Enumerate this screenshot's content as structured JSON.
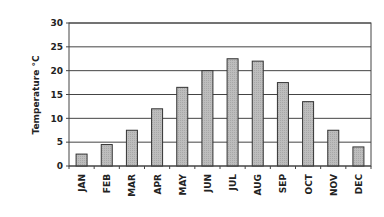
{
  "chart_data": {
    "type": "bar",
    "title": "",
    "xlabel": "",
    "ylabel": "Temperature °C",
    "ylim": [
      0,
      30
    ],
    "yticks": [
      0,
      5,
      10,
      15,
      20,
      25,
      30
    ],
    "grid": true,
    "legend": null,
    "categories": [
      "JAN",
      "FEB",
      "MAR",
      "APR",
      "MAY",
      "JUN",
      "JUL",
      "AUG",
      "SEP",
      "OCT",
      "NOV",
      "DEC"
    ],
    "values": [
      2.5,
      4.5,
      7.5,
      12,
      16.5,
      20,
      22.5,
      22,
      17.5,
      13.5,
      7.5,
      4
    ],
    "bar_color": "#b8b8b8",
    "bar_edge_color": "#333333"
  }
}
